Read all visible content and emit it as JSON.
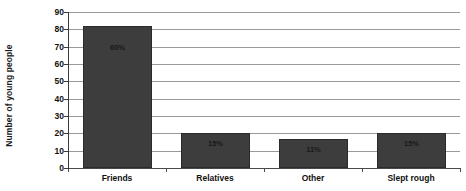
{
  "chart_data": {
    "type": "bar",
    "title": "",
    "subtitle": "",
    "xlabel": "",
    "ylabel": "Number of young people",
    "categories": [
      "Friends",
      "Relatives",
      "Other",
      "Slept rough"
    ],
    "values": [
      82,
      20,
      17,
      20
    ],
    "data_labels": [
      "60%",
      "15%",
      "11%",
      "15%"
    ],
    "ylim": [
      0,
      90
    ],
    "ytick_step": 10,
    "ytick_labels": [
      "90",
      "80",
      "70",
      "60",
      "50",
      "40",
      "30",
      "20",
      "10",
      "0"
    ],
    "ytick_values": [
      90,
      80,
      70,
      60,
      50,
      40,
      30,
      20,
      10,
      0
    ],
    "grid": true,
    "legend": false,
    "legend_position": "none",
    "series": [
      {
        "name": "Number of young people",
        "values": [
          82,
          20,
          17,
          20
        ],
        "labels": [
          "60%",
          "15%",
          "11%",
          "15%"
        ]
      }
    ],
    "colors": {
      "bar_fill": "#3d3d3d",
      "bar_border": "#2b2b2b",
      "gridline": "#9a9a9a",
      "axis": "#3a3a3a",
      "text": "#111111",
      "background": "#ffffff"
    }
  }
}
